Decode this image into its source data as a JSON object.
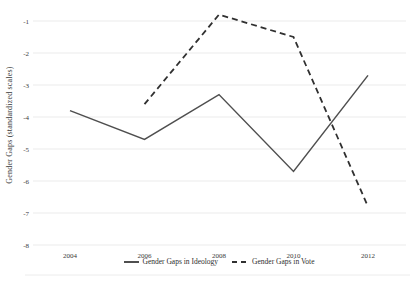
{
  "figure": {
    "background": "#ffffff",
    "solid_line_color": "#4f4f4f",
    "dashed_line_color": "#303030",
    "gridline_color": "#ebebeb",
    "tick_text_color": "#3a3a3a"
  },
  "chart_data": {
    "type": "line",
    "title": "",
    "xlabel": "",
    "ylabel": "Gender Gaps (standardized scales)",
    "x_ticks": [
      "2004",
      "2006",
      "2008",
      "2010",
      "2012"
    ],
    "y_ticks": [
      -1,
      -2,
      -3,
      -4,
      -5,
      -6,
      -7,
      -8
    ],
    "ylim": [
      -8.3,
      -0.6
    ],
    "grid": "horizontal-only",
    "legend_position": "bottom-center",
    "series": [
      {
        "name": "Gender Gaps in Ideology",
        "line_style": "solid",
        "x": [
          2004,
          2006,
          2008,
          2010,
          2012
        ],
        "values": [
          -3.8,
          -4.7,
          -3.3,
          -5.7,
          -2.7
        ]
      },
      {
        "name": "Gender Gaps in Vote",
        "line_style": "dashed",
        "x": [
          2006,
          2008,
          2010,
          2012
        ],
        "values": [
          -3.6,
          -0.8,
          -1.5,
          -6.8
        ]
      }
    ]
  }
}
